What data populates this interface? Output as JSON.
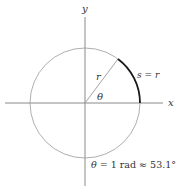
{
  "diagram": {
    "axes": {
      "x_label": "x",
      "y_label": "y"
    },
    "circle": {
      "radius_label": "r",
      "angle_label": "θ",
      "arc_label": "s = r"
    },
    "caption": {
      "theta": "θ",
      "rest": " = 1 rad ≈ 53.1°"
    },
    "colors": {
      "axis": "#8a8a8a",
      "circle": "#9a9a9a",
      "arc": "#1a1a1a",
      "text": "#333333"
    }
  }
}
